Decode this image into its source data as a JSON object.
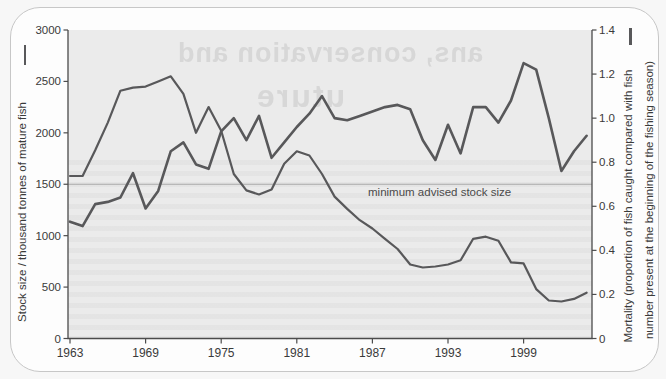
{
  "watermark": {
    "line1": "ans, conservation and",
    "line2": "uture"
  },
  "annotation": {
    "text": "minimum advised stock size",
    "value_left_axis": 1500
  },
  "colors": {
    "plot_background": "#ebebeb",
    "series_line": "#58585a",
    "axis_line": "#4c4c4c",
    "minimum_line": "#aaaaaa",
    "card_border": "#c7c7c7",
    "ghost_text": "#d7d7d7"
  },
  "chart_data": {
    "type": "line",
    "title": "",
    "grid": "off",
    "legend_position": "axis-label-markers",
    "left_axis": {
      "label": "Stock size / thousand tonnes of mature fish",
      "range": [
        0,
        3000
      ],
      "ticks": [
        "0",
        "500",
        "1000",
        "1500",
        "2000",
        "2500",
        "3000"
      ],
      "tick_values": [
        0,
        500,
        1000,
        1500,
        2000,
        2500,
        3000
      ]
    },
    "right_axis": {
      "label_line1": "Mortality (proportion of fish caught compared with fish",
      "label_line2": "number present at the beginning of the fishing season)",
      "range": [
        0,
        1.4
      ],
      "ticks": [
        "0",
        "0.2",
        "0.4",
        "0.6",
        "0.8",
        "1.0",
        "1.2",
        "1.4"
      ],
      "tick_values": [
        0,
        0.2,
        0.4,
        0.6,
        0.8,
        1.0,
        1.2,
        1.4
      ]
    },
    "x_axis": {
      "range": [
        1963,
        2004
      ],
      "ticks": [
        1963,
        1969,
        1975,
        1981,
        1987,
        1993,
        1999
      ]
    },
    "reference_line": {
      "axis": "left",
      "value": 1500,
      "label": "minimum advised stock size"
    },
    "years": [
      1963,
      1964,
      1965,
      1966,
      1967,
      1968,
      1969,
      1970,
      1971,
      1972,
      1973,
      1974,
      1975,
      1976,
      1977,
      1978,
      1979,
      1980,
      1981,
      1982,
      1983,
      1984,
      1985,
      1986,
      1987,
      1988,
      1989,
      1990,
      1991,
      1992,
      1993,
      1994,
      1995,
      1996,
      1997,
      1998,
      1999,
      2000,
      2001,
      2002,
      2003,
      2004
    ],
    "series": [
      {
        "name": "Stock size",
        "axis": "left",
        "line_width": 2.2,
        "values": [
          1580,
          1580,
          1830,
          2100,
          2410,
          2440,
          2450,
          2500,
          2550,
          2380,
          2000,
          2250,
          2020,
          1600,
          1440,
          1400,
          1450,
          1700,
          1820,
          1780,
          1600,
          1380,
          1260,
          1150,
          1070,
          970,
          870,
          720,
          690,
          700,
          720,
          760,
          970,
          990,
          950,
          740,
          730,
          480,
          370,
          360,
          385,
          445
        ]
      },
      {
        "name": "Mortality",
        "axis": "right",
        "line_width": 2.6,
        "values": [
          0.53,
          0.51,
          0.61,
          0.62,
          0.64,
          0.75,
          0.59,
          0.67,
          0.85,
          0.89,
          0.79,
          0.77,
          0.94,
          1.0,
          0.9,
          1.01,
          0.82,
          0.89,
          0.96,
          1.02,
          1.1,
          1.0,
          0.99,
          1.01,
          1.03,
          1.05,
          1.06,
          1.04,
          0.9,
          0.81,
          0.97,
          0.84,
          1.05,
          1.05,
          0.98,
          1.08,
          1.25,
          1.22,
          1.0,
          0.76,
          0.85,
          0.92
        ]
      }
    ]
  }
}
